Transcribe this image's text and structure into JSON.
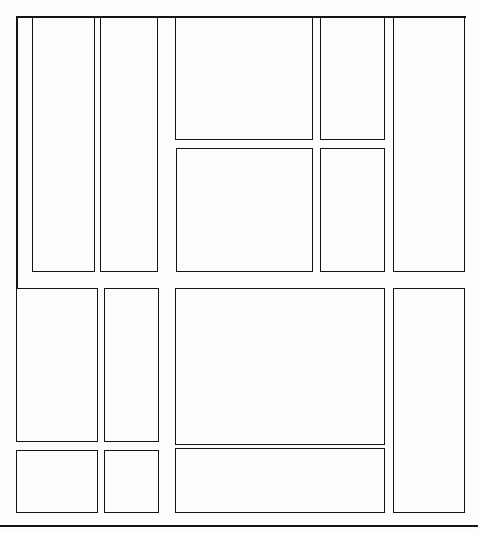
{
  "document": {
    "title": "Page Layout Segmentation",
    "page_number": "1",
    "canvas_width": 478,
    "canvas_height": 533,
    "background_color": "#fdfdfd",
    "stroke_color": "#141414",
    "stroke_width_px": 1.6
  },
  "legend": {
    "region_kind": "text-block",
    "units": "px"
  },
  "rule": {
    "name": "footer-separator",
    "x": 0,
    "y": 525,
    "width": 478,
    "height": 2
  },
  "frame_lines": [
    {
      "name": "upper-left-frame-vertical",
      "x": 16,
      "y": 16,
      "width": 1.6,
      "height": 273
    },
    {
      "name": "upper-frame-horizontal",
      "x": 16,
      "y": 16,
      "width": 450,
      "height": 1.6
    }
  ],
  "sections": [
    {
      "name": "upper-half",
      "label": "Upper half",
      "y_range": [
        16,
        272
      ],
      "regions": [
        {
          "id": "r1",
          "label": "Column 1 text block",
          "x": 32,
          "y": 16,
          "width": 63,
          "height": 256
        },
        {
          "id": "r2",
          "label": "Column 2 text block",
          "x": 100,
          "y": 16,
          "width": 58,
          "height": 256
        },
        {
          "id": "r3",
          "label": "Center upper text block",
          "x": 175,
          "y": 16,
          "width": 138,
          "height": 124
        },
        {
          "id": "r4",
          "label": "Center lower text block",
          "x": 176,
          "y": 148,
          "width": 137,
          "height": 124
        },
        {
          "id": "r5",
          "label": "Right inner upper text block",
          "x": 320,
          "y": 16,
          "width": 65,
          "height": 124
        },
        {
          "id": "r6",
          "label": "Right inner lower text block",
          "x": 320,
          "y": 148,
          "width": 65,
          "height": 124
        },
        {
          "id": "r7",
          "label": "Far right tall text block",
          "x": 393,
          "y": 16,
          "width": 72,
          "height": 256
        }
      ]
    },
    {
      "name": "lower-half",
      "label": "Lower half",
      "y_range": [
        288,
        513
      ],
      "regions": [
        {
          "id": "r8",
          "label": "Lower column 1 text block",
          "x": 16,
          "y": 288,
          "width": 82,
          "height": 154
        },
        {
          "id": "r9",
          "label": "Lower column 2 text block",
          "x": 104,
          "y": 288,
          "width": 55,
          "height": 154
        },
        {
          "id": "r10",
          "label": "Main body text block",
          "x": 175,
          "y": 288,
          "width": 210,
          "height": 157
        },
        {
          "id": "r11",
          "label": "Lower far right tall block",
          "x": 393,
          "y": 288,
          "width": 72,
          "height": 225
        },
        {
          "id": "r12",
          "label": "Footer column 1 block",
          "x": 16,
          "y": 450,
          "width": 82,
          "height": 63
        },
        {
          "id": "r13",
          "label": "Footer column 2 block",
          "x": 104,
          "y": 450,
          "width": 55,
          "height": 63
        },
        {
          "id": "r14",
          "label": "Footer wide body block",
          "x": 175,
          "y": 448,
          "width": 210,
          "height": 65
        }
      ]
    }
  ]
}
